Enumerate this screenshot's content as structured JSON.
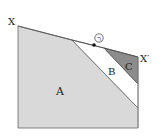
{
  "figure": {
    "type": "geologic-cross-section",
    "profile_start_label": "X",
    "profile_end_label": "X′",
    "marker_label": "ㄱ",
    "layers": [
      {
        "id": "A",
        "label": "A",
        "fill": "#d9d9d9"
      },
      {
        "id": "B",
        "label": "B",
        "fill": "#ffffff"
      },
      {
        "id": "C",
        "label": "C",
        "fill": "#8c8c8c"
      }
    ],
    "colors": {
      "outline": "#555555",
      "marker_dot": "#111111"
    }
  }
}
